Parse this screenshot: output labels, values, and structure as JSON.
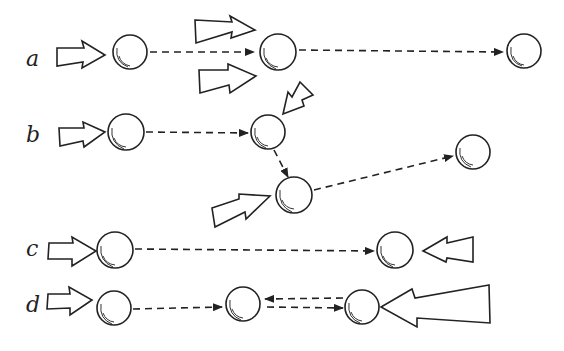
{
  "diagram": {
    "title": "",
    "rows": [
      {
        "label": "a",
        "description": "Ball pushed, then struck again by two forces from same direction; travels far"
      },
      {
        "label": "b",
        "description": "Ball pushed, deflected by angled forces, changes direction twice"
      },
      {
        "label": "c",
        "description": "Ball pushed, travels to be met by opposing force"
      },
      {
        "label": "d",
        "description": "Ball pushed, meets opposing larger force, bounces back and forth"
      }
    ],
    "legend": {
      "ball": "sphere / particle",
      "dashed_arrow": "path of motion",
      "hollow_arrow": "applied force (push)"
    }
  }
}
